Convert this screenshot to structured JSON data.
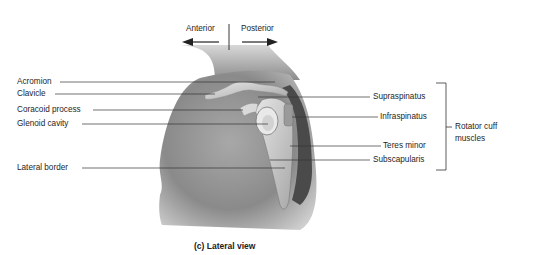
{
  "figure": {
    "caption": "(c) Lateral view",
    "orientation": {
      "anterior_label": "Anterior",
      "posterior_label": "Posterior"
    },
    "left_labels": [
      {
        "text": "Acromion"
      },
      {
        "text": "Clavicle"
      },
      {
        "text": "Coracoid process"
      },
      {
        "text": "Glenoid cavity"
      },
      {
        "text": "Lateral border"
      }
    ],
    "right_labels": [
      {
        "text": "Supraspinatus"
      },
      {
        "text": "Infraspinatus"
      },
      {
        "text": "Teres minor"
      },
      {
        "text": "Subscapularis"
      }
    ],
    "bracket_label_line1": "Rotator cuff",
    "bracket_label_line2": "muscles"
  }
}
